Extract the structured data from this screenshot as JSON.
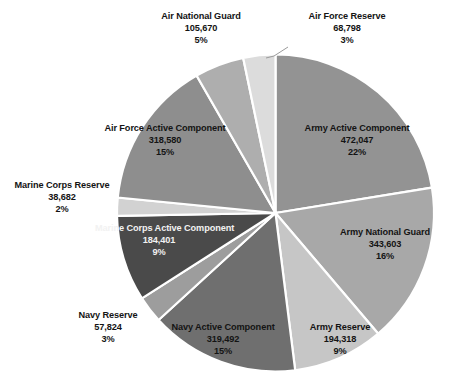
{
  "chart_data": {
    "type": "pie",
    "title": "",
    "subtitle": "",
    "legend_position": "none",
    "grid": false,
    "total": 2103415,
    "categories": [
      "Army Active Component",
      "Army National Guard",
      "Army Reserve",
      "Navy Active Component",
      "Navy Reserve",
      "Marine Corps Active Component",
      "Marine Corps Reserve",
      "Air Force Active Component",
      "Air National Guard",
      "Air Force Reserve"
    ],
    "values": [
      472047,
      343603,
      194318,
      319492,
      57824,
      184401,
      38682,
      318580,
      105670,
      68798
    ],
    "percent_labels": [
      "22%",
      "16%",
      "9%",
      "15%",
      "3%",
      "9%",
      "2%",
      "15%",
      "5%",
      "3%"
    ],
    "value_labels": [
      "472,047",
      "343,603",
      "194,318",
      "319,492",
      "57,824",
      "184,401",
      "38,682",
      "318,580",
      "105,670",
      "68,798"
    ],
    "colors": [
      "#939393",
      "#a8a8a8",
      "#c6c6c6",
      "#6f6f6f",
      "#9d9d9d",
      "#4a4a4a",
      "#d2d2d2",
      "#8e8e8e",
      "#aeaeae",
      "#dcdcdc"
    ],
    "start_angle_deg": 0,
    "direction": "clockwise",
    "slices": [
      {
        "name": "Army Active Component",
        "value": 472047,
        "value_label": "472,047",
        "percent_label": "22%",
        "percent": 22.4,
        "color": "#939393",
        "label_placement": "inside",
        "label_text_color": "#141414"
      },
      {
        "name": "Army National Guard",
        "value": 343603,
        "value_label": "343,603",
        "percent_label": "16%",
        "percent": 16.3,
        "color": "#a8a8a8",
        "label_placement": "inside",
        "label_text_color": "#141414"
      },
      {
        "name": "Army Reserve",
        "value": 194318,
        "value_label": "194,318",
        "percent_label": "9%",
        "percent": 9.2,
        "color": "#c6c6c6",
        "label_placement": "inside",
        "label_text_color": "#141414"
      },
      {
        "name": "Navy Active Component",
        "value": 319492,
        "value_label": "319,492",
        "percent_label": "15%",
        "percent": 15.2,
        "color": "#6f6f6f",
        "label_placement": "inside",
        "label_text_color": "#141414"
      },
      {
        "name": "Navy Reserve",
        "value": 57824,
        "value_label": "57,824",
        "percent_label": "3%",
        "percent": 2.7,
        "color": "#9d9d9d",
        "label_placement": "outside",
        "label_text_color": "#141414"
      },
      {
        "name": "Marine Corps Active Component",
        "value": 184401,
        "value_label": "184,401",
        "percent_label": "9%",
        "percent": 8.8,
        "color": "#4a4a4a",
        "label_placement": "inside",
        "label_text_color": "#f2f2f2"
      },
      {
        "name": "Marine Corps Reserve",
        "value": 38682,
        "value_label": "38,682",
        "percent_label": "2%",
        "percent": 1.8,
        "color": "#d2d2d2",
        "label_placement": "outside",
        "label_text_color": "#141414"
      },
      {
        "name": "Air Force Active Component",
        "value": 318580,
        "value_label": "318,580",
        "percent_label": "15%",
        "percent": 15.1,
        "color": "#8e8e8e",
        "label_placement": "inside",
        "label_text_color": "#141414"
      },
      {
        "name": "Air National Guard",
        "value": 105670,
        "value_label": "105,670",
        "percent_label": "5%",
        "percent": 5.0,
        "color": "#aeaeae",
        "label_placement": "outside",
        "label_text_color": "#141414"
      },
      {
        "name": "Air Force Reserve",
        "value": 68798,
        "value_label": "68,798",
        "percent_label": "3%",
        "percent": 3.3,
        "color": "#dcdcdc",
        "label_placement": "outside",
        "label_text_color": "#141414"
      }
    ]
  }
}
